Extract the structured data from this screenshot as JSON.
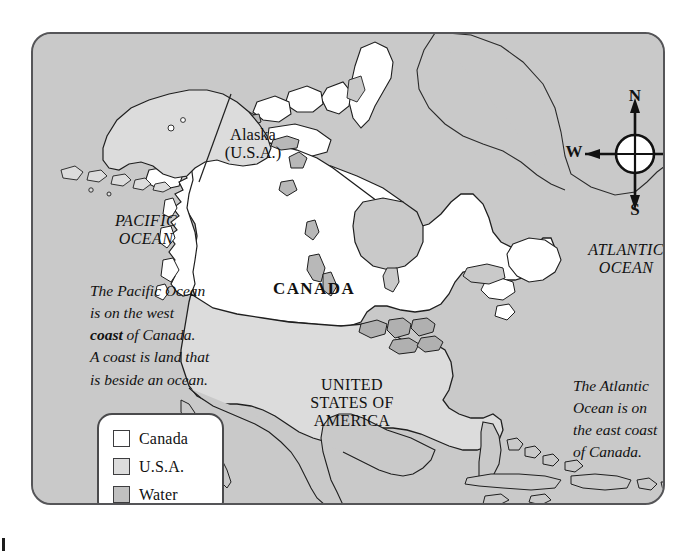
{
  "map": {
    "frame_border_color": "#555558",
    "ocean_color": "#c9c9c9",
    "canada_color": "#ffffff",
    "usa_color": "#dcdcdc",
    "labels": {
      "alaska": "Alaska\n(U.S.A.)",
      "pacific_ocean": "PACIFIC\nOCEAN",
      "atlantic_ocean": "ATLANTIC\nOCEAN",
      "canada": "CANADA",
      "united_states": "UNITED\nSTATES OF\nAMERICA"
    }
  },
  "notes": {
    "pacific": {
      "line1": "The Pacific Ocean",
      "line2": "is on the west",
      "line3_pre": "",
      "line3_bold": "coast",
      "line3_post": " of Canada.",
      "line4": "A coast is land that",
      "line5": "is beside an ocean."
    },
    "atlantic": {
      "line1": "The Atlantic",
      "line2": "Ocean is on",
      "line3": "the east coast",
      "line4": "of Canada."
    }
  },
  "compass": {
    "north": "N",
    "south": "S",
    "east": "E",
    "west": "W"
  },
  "legend": {
    "items": [
      {
        "label": "Canada",
        "color": "#ffffff"
      },
      {
        "label": "U.S.A.",
        "color": "#dcdcdc"
      },
      {
        "label": "Water",
        "color": "#c0c0c0"
      }
    ]
  }
}
